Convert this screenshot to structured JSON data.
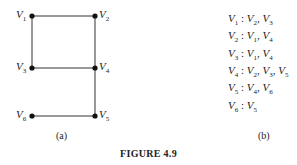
{
  "figure": {
    "title": "FIGURE 4.9",
    "panel_a_caption": "(a)",
    "panel_b_caption": "(b)"
  },
  "graph": {
    "nodes": [
      {
        "id": "V1",
        "label": "V",
        "sub": "1",
        "x": 32,
        "y": 16
      },
      {
        "id": "V2",
        "label": "V",
        "sub": "2",
        "x": 95,
        "y": 16
      },
      {
        "id": "V3",
        "label": "V",
        "sub": "3",
        "x": 32,
        "y": 68
      },
      {
        "id": "V4",
        "label": "V",
        "sub": "4",
        "x": 95,
        "y": 68
      },
      {
        "id": "V5",
        "label": "V",
        "sub": "5",
        "x": 95,
        "y": 116
      },
      {
        "id": "V6",
        "label": "V",
        "sub": "6",
        "x": 32,
        "y": 116
      }
    ],
    "edges": [
      [
        "V1",
        "V2"
      ],
      [
        "V1",
        "V3"
      ],
      [
        "V2",
        "V4"
      ],
      [
        "V3",
        "V4"
      ],
      [
        "V4",
        "V5"
      ],
      [
        "V5",
        "V6"
      ]
    ]
  },
  "adjacency_list": [
    {
      "vertex": "V1",
      "neighbors": [
        "V2",
        "V3"
      ]
    },
    {
      "vertex": "V2",
      "neighbors": [
        "V1",
        "V4"
      ]
    },
    {
      "vertex": "V3",
      "neighbors": [
        "V1",
        "V4"
      ]
    },
    {
      "vertex": "V4",
      "neighbors": [
        "V2",
        "V3",
        "V5"
      ]
    },
    {
      "vertex": "V5",
      "neighbors": [
        "V4",
        "V6"
      ]
    },
    {
      "vertex": "V6",
      "neighbors": [
        "V5"
      ]
    }
  ]
}
